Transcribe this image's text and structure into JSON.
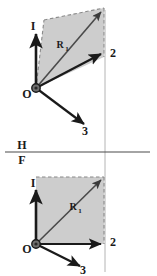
{
  "figure": {
    "background_color": "#ffffff",
    "ink_color": "#1a1a1a",
    "fill_color": "#cdcdcd",
    "dash_color": "#8a8a8a",
    "projector_color": "#b4b4b4"
  },
  "ground_line": {
    "upper_label": "H",
    "lower_label": "F",
    "x_start": 5,
    "x_end": 150,
    "y": 152
  },
  "top_view": {
    "name": "horizontal-view",
    "origin_label": "O",
    "resultant_label": "R",
    "resultant_subscript": "1",
    "axes": [
      {
        "id": "axis-1",
        "label": "I"
      },
      {
        "id": "axis-2",
        "label": "2"
      },
      {
        "id": "axis-3",
        "label": "3"
      }
    ]
  },
  "bottom_view": {
    "name": "frontal-view",
    "origin_label": "O",
    "resultant_label": "R",
    "resultant_subscript": "1",
    "axes": [
      {
        "id": "axis-1",
        "label": "I"
      },
      {
        "id": "axis-2",
        "label": "2"
      },
      {
        "id": "axis-3",
        "label": "3"
      }
    ]
  }
}
